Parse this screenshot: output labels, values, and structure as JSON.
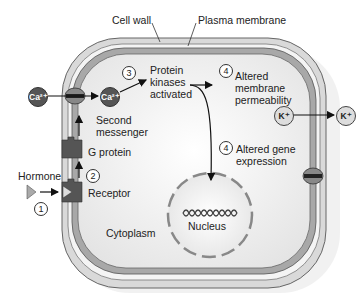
{
  "labels": {
    "cell_wall": "Cell wall",
    "plasma_membrane": "Plasma membrane",
    "protein_kinases": [
      "Protein",
      "kinases",
      "activated"
    ],
    "altered_membrane": [
      "Altered",
      "membrane",
      "permeability"
    ],
    "second_messenger": [
      "Second",
      "messenger"
    ],
    "g_protein": "G protein",
    "hormone": "Hormone",
    "receptor": "Receptor",
    "altered_gene": [
      "Altered gene",
      "expression"
    ],
    "nucleus": "Nucleus",
    "cytoplasm": "Cytoplasm"
  },
  "steps": {
    "s1": "1",
    "s2": "2",
    "s3": "3",
    "s4a": "4",
    "s4b": "4"
  },
  "ions": {
    "ca_out": "Ca²⁺",
    "ca_in": "Ca²⁺",
    "k_in": "K⁺",
    "k_out": "K⁺"
  },
  "colors": {
    "wall": "#c8c8c8",
    "membrane": "#9a9a9a",
    "cytoplasm": "#f2f2f2",
    "dark_protein": "#555555"
  }
}
